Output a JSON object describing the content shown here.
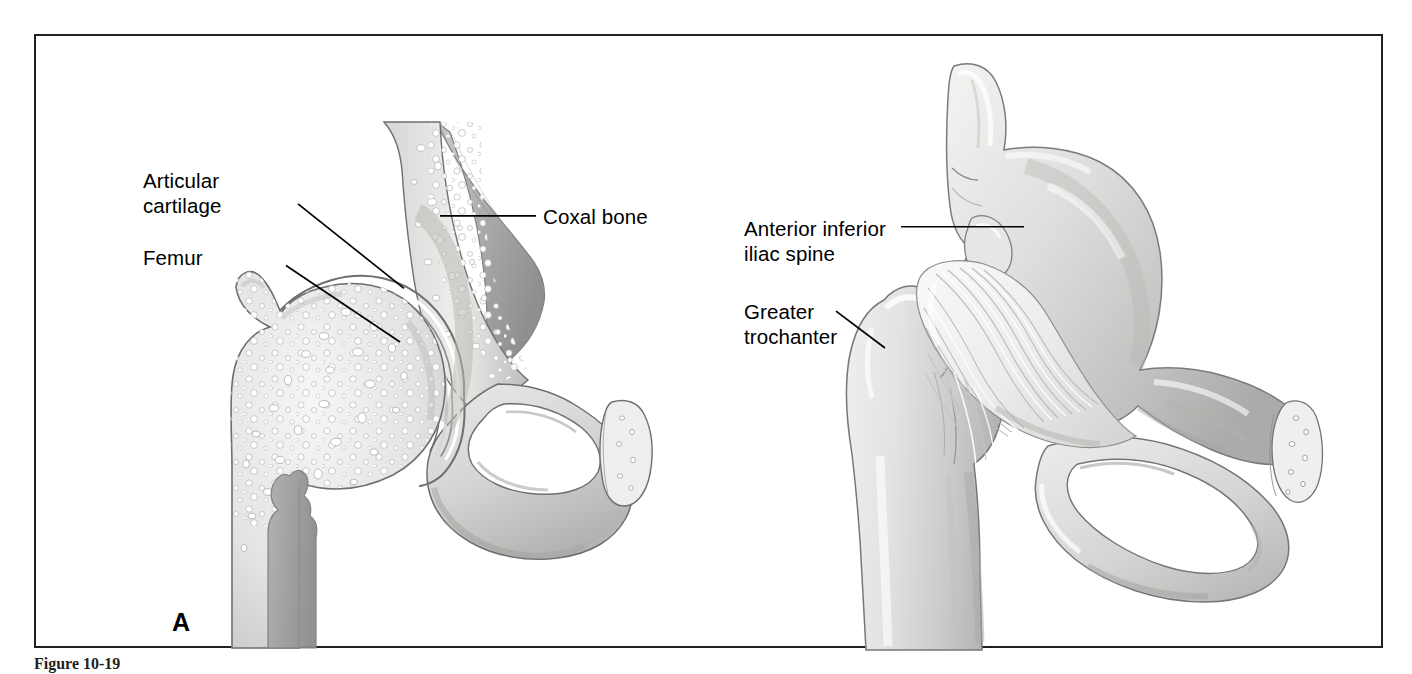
{
  "figure": {
    "panels": [
      {
        "id": "A",
        "letter": "A",
        "description": "Coronal section through the hip joint showing spongy bone, articular cartilage and the femoral head within the acetabulum",
        "labels": [
          {
            "name": "articular-cartilage",
            "text": "Articular\ncartilage",
            "x": 107,
            "y": 145,
            "align": "left",
            "leader": {
              "x1": 262,
              "y1": 169,
              "x2": 368,
              "y2": 254
            }
          },
          {
            "name": "femur",
            "text": "Femur",
            "x": 107,
            "y": 221,
            "align": "left",
            "leader": {
              "x1": 250,
              "y1": 231,
              "x2": 364,
              "y2": 308
            }
          },
          {
            "name": "coxal-bone",
            "text": "Coxal bone",
            "x": 507,
            "y": 168,
            "align": "left",
            "leader": {
              "x1": 500,
              "y1": 181,
              "x2": 404,
              "y2": 181
            }
          }
        ]
      },
      {
        "id": "B",
        "letter": "B",
        "description": "Anterior view of the hip joint showing the iliofemoral ligament spanning from the ilium to the femur",
        "labels": [
          {
            "name": "anterior-inferior-iliac-spine",
            "text": "Anterior inferior\niliac spine",
            "x": 708,
            "y": 180,
            "align": "left",
            "leader": {
              "x1": 865,
              "y1": 192,
              "x2": 988,
              "y2": 192
            }
          },
          {
            "name": "greater-trochanter",
            "text": "Greater\ntrochanter",
            "x": 708,
            "y": 263,
            "align": "left",
            "leader": {
              "x1": 800,
              "y1": 277,
              "x2": 849,
              "y2": 314
            }
          }
        ]
      }
    ],
    "caption": "Figure 10-19"
  },
  "colors": {
    "frame_border": "#231f20",
    "background": "#ffffff",
    "leader_line": "#000000",
    "label_text": "#000000",
    "bone_light": "#e8e8e6",
    "bone_mid": "#cfcfcd",
    "bone_dark": "#a8a8a6",
    "bone_outline": "#6b6b6b",
    "cavity": "#9a9a98",
    "ligament": "#f1f1ef"
  }
}
